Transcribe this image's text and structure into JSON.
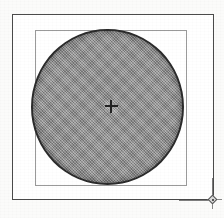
{
  "document": {
    "kind": "scanned-technical-drawing",
    "background_color": "#fbfbfa",
    "width": 224,
    "height": 218
  },
  "frame": {
    "label": "drawing border",
    "color": "#4b4b4b",
    "x": 12,
    "y": 14,
    "width": 202,
    "height": 186
  },
  "inner_square": {
    "label": "bounding square",
    "color": "#9a9a9a",
    "x": 35,
    "y": 30,
    "width": 152,
    "height": 156
  },
  "circle": {
    "label": "shaded circle",
    "outline_color": "#2b2b2b",
    "fill_color": "#8c8c8c",
    "fill_pattern": "halftone-dither",
    "center_x": 107,
    "center_y": 105,
    "diameter": 153
  },
  "center_mark": {
    "label": "center crosshair",
    "icon": "crosshair-plus-icon",
    "color": "#232323",
    "x": 111,
    "y": 106
  },
  "corner_handle": {
    "label": "corner registration handle",
    "icon": "diamond-crosshair-icon",
    "node_color": "#d9d9d9",
    "line_color": "#7d7d7d",
    "x": 213,
    "y": 200
  }
}
